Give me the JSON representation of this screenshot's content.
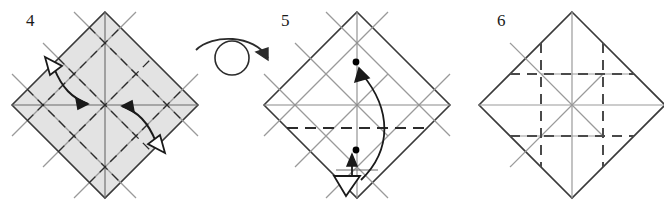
{
  "figure": {
    "kind": "origami-folding-instructions",
    "total_steps_shown": 3,
    "background_color": "#ffffff"
  },
  "colors": {
    "outline": "#3a3a3a",
    "crease_gray": "#9a9a9a",
    "crease_dashed": "#2b2b2b",
    "paper_shaded": "#e3e3e3",
    "paper_white": "#ffffff",
    "arrow_solid": "#1a1a1a",
    "dot": "#000000"
  },
  "panels": [
    {
      "id": "panel-4",
      "number": "4",
      "paper_fill": "#e3e3e3",
      "shape": "square-rotated-45",
      "center": {
        "x": 105,
        "y": 105
      },
      "half_diagonal": 93,
      "creases": {
        "gray_solid_count": 6,
        "dashed_count": 6,
        "description": "grid of thirds plus both diagonals"
      },
      "arrows": [
        {
          "name": "fold-arrow-upper-left",
          "head_solid": "down-right",
          "head_hollow": "up-left",
          "meaning": "reverse fold"
        },
        {
          "name": "fold-arrow-lower-right",
          "head_solid": "up-left",
          "head_hollow": "down-right",
          "meaning": "reverse fold"
        }
      ]
    },
    {
      "id": "panel-5",
      "number": "5",
      "paper_fill": "#ffffff",
      "shape": "square-rotated-45",
      "center": {
        "x": 357,
        "y": 105
      },
      "half_diagonal": 93,
      "creases": {
        "gray_solid_count": 6,
        "dashed_count": 1,
        "description": "lattice of thirds with one bold dashed valley fold across the middle"
      },
      "dots": [
        {
          "name": "reference-dot-upper",
          "x": 356,
          "y": 62
        },
        {
          "name": "reference-dot-lower",
          "x": 356,
          "y": 150
        }
      ],
      "arrows": [
        {
          "name": "bring-point-arrow",
          "head_solid": "up",
          "meaning": "bring lower point up to upper point"
        },
        {
          "name": "return-arrow-hollow",
          "head_hollow": "down-left",
          "meaning": "unfold back"
        }
      ]
    },
    {
      "id": "panel-6",
      "number": "6",
      "paper_fill": "#ffffff",
      "shape": "square-rotated-45",
      "center": {
        "x": 572,
        "y": 105
      },
      "half_diagonal": 93,
      "creases": {
        "gray_solid_count": 6,
        "dashed_count": 4,
        "description": "completed crease pattern: dashed grid of thirds forming a tic-tac-toe square"
      },
      "arrows": []
    }
  ],
  "symbols": [
    {
      "name": "turn-over-symbol",
      "type": "circle-with-curved-arrow",
      "x": 232,
      "y": 55,
      "meaning": "turn the model over"
    }
  ]
}
